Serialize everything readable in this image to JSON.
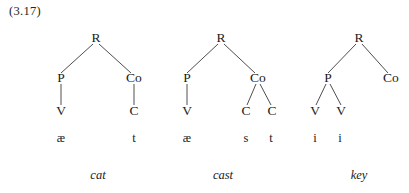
{
  "figure": {
    "example_number": "(3.17)",
    "caption_marks": "tilde-above-numeral"
  },
  "trees": [
    {
      "id": "tree-cat",
      "word": "cat",
      "nodes": {
        "root": "R",
        "peak_label": "P",
        "coda_label": "Co",
        "v1": "V",
        "c1": "C"
      },
      "leaves": {
        "leaf1": "æ",
        "leaf2": "t"
      }
    },
    {
      "id": "tree-cast",
      "word": "cast",
      "nodes": {
        "root": "R",
        "peak_label": "P",
        "coda_label": "Co",
        "v1": "V",
        "c1": "C",
        "c2": "C"
      },
      "leaves": {
        "leaf1": "æ",
        "leaf2": "s",
        "leaf3": "t"
      }
    },
    {
      "id": "tree-key",
      "word": "key",
      "nodes": {
        "root": "R",
        "peak_label": "P",
        "coda_label": "Co",
        "v1": "V",
        "v2": "V"
      },
      "leaves": {
        "leaf1": "i",
        "leaf2": "i"
      }
    }
  ],
  "colors": {
    "background": "#ffffff",
    "text": "#1b1b1b",
    "branch": "#3a3a3a"
  }
}
